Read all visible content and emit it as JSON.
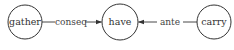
{
  "nodes": [
    {
      "id": "gather",
      "label": "gather"
    },
    {
      "id": "have",
      "label": "have"
    },
    {
      "id": "carry",
      "label": "carry"
    }
  ],
  "edges": [
    {
      "from": "gather",
      "to": "have",
      "label": "conseq"
    },
    {
      "from": "carry",
      "to": "have",
      "label": "ante"
    }
  ],
  "colors": {
    "stroke": "#333333",
    "background": "#ffffff"
  }
}
